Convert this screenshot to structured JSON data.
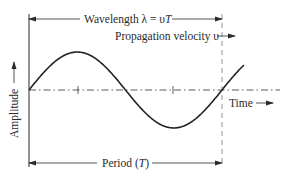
{
  "diagram": {
    "type": "sine-wave-annotation",
    "labels": {
      "wavelength": "Wavelength λ = υT",
      "wavelength_prefix": "Wavelength λ = υ",
      "wavelength_T": "T",
      "propagation": "Propagation velocity υ",
      "amplitude": "Amplitude",
      "time": "Time",
      "period": "Period (T)",
      "period_prefix": "Period (",
      "period_T": "T",
      "period_suffix": ")"
    },
    "colors": {
      "stroke": "#2a2a2a",
      "dash": "#555555",
      "background": "#ffffff"
    },
    "wave": {
      "start_x": 29,
      "baseline_y": 90,
      "wavelength_px": 193,
      "amplitude_px": 38,
      "end_x": 244
    },
    "ticks_x": [
      78,
      173
    ]
  }
}
